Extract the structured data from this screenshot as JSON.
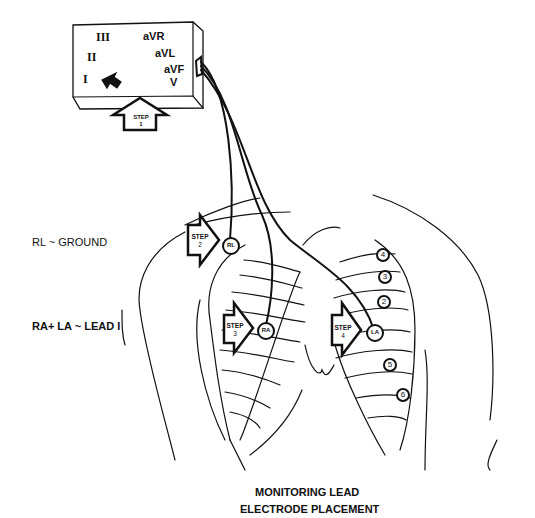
{
  "monitor": {
    "leads_left": [
      "III",
      "II",
      "I"
    ],
    "leads_right": [
      "aVR",
      "aVL",
      "aVF",
      "V"
    ]
  },
  "steps": [
    {
      "label": "STEP",
      "number": "1"
    },
    {
      "label": "STEP",
      "number": "2"
    },
    {
      "label": "STEP",
      "number": "3"
    },
    {
      "label": "STEP",
      "number": "4"
    }
  ],
  "electrodes": {
    "rl": "RL",
    "ra": "RA",
    "la": "LA"
  },
  "chest_positions": [
    "4",
    "3",
    "2",
    "5",
    "6"
  ],
  "legend": {
    "ground": "RL ~ GROUND",
    "lead1": "RA+ LA ~ LEAD I"
  },
  "caption": {
    "line1": "MONITORING LEAD",
    "line2": "ELECTRODE PLACEMENT"
  }
}
